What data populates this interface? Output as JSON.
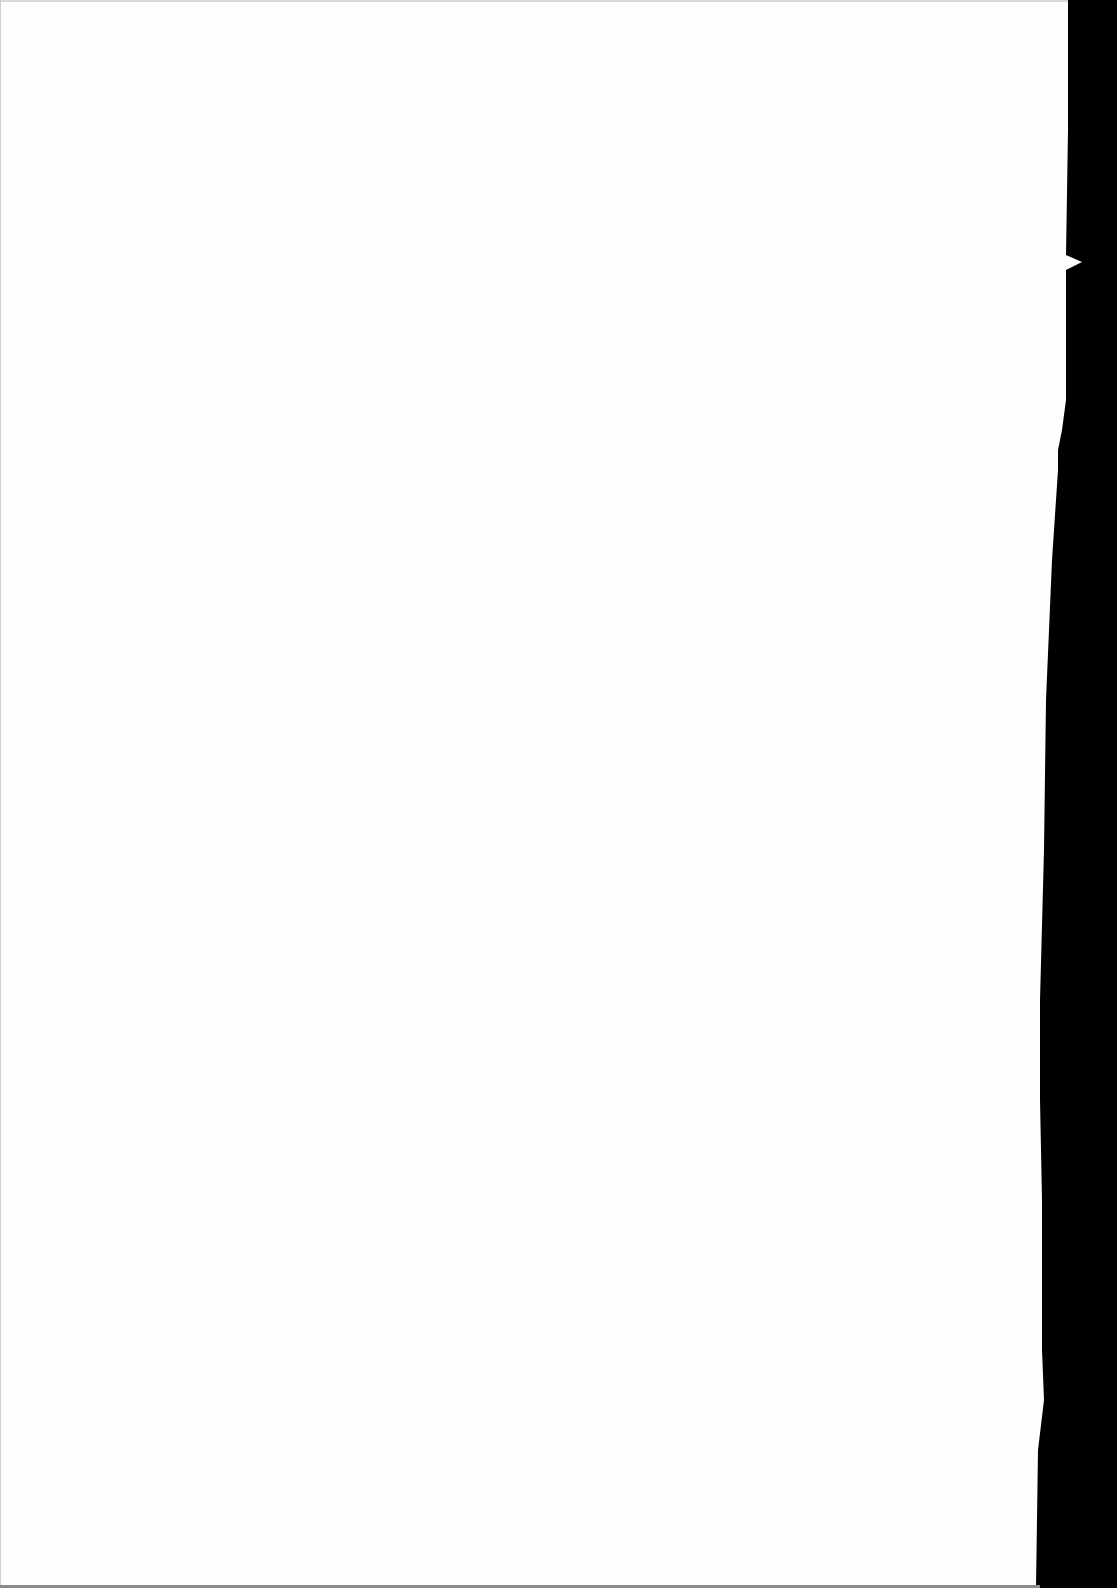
{
  "document": {
    "type": "scanned-blank-page",
    "text_content": "",
    "colors": {
      "paper": "#fefefc",
      "scan_border": "#000000"
    }
  }
}
